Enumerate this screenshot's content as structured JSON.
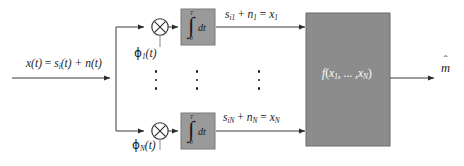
{
  "diagram": {
    "input_signal": {
      "label_plain": "x(t) = sᵢ(t) + n(t)",
      "x_of_t": "x(t) ",
      "equals": "= ",
      "s_sym": "s",
      "s_sub": "i",
      "s_tail": "(t) + ",
      "n_sym": "n",
      "n_tail": "(t)"
    },
    "branches": [
      {
        "index": "1",
        "multiplier_symbol": "✕",
        "multiplier_name": "multiplier",
        "reference_label_plain": "ϕ₁(t)",
        "reference_glyph": "ϕ",
        "reference_sub": "1",
        "reference_tail": "(t)",
        "integrator_upper_limit": "T",
        "integrator_lower_limit": "0",
        "integrator_symbol": "∫",
        "integrator_differential": "dt",
        "output_label_plain": "sᵢ₁ + n₁ = x₁",
        "out_s": "s",
        "out_s_sub": "i1",
        "out_plus": " + ",
        "out_n": "n",
        "out_n_sub": "1",
        "out_eq": " = ",
        "out_x": "x",
        "out_x_sub": "1"
      },
      {
        "index": "N",
        "multiplier_symbol": "✕",
        "multiplier_name": "multiplier",
        "reference_label_plain": "ϕₙ(t)",
        "reference_glyph": "ϕ",
        "reference_sub": "N",
        "reference_tail": "(t)",
        "integrator_upper_limit": "T",
        "integrator_lower_limit": "0",
        "integrator_symbol": "∫",
        "integrator_differential": "dt",
        "output_label_plain": "sᵢₙ + nₙ = xₙ",
        "out_s": "s",
        "out_s_sub": "iN",
        "out_plus": " + ",
        "out_n": "n",
        "out_n_sub": "N",
        "out_eq": " = ",
        "out_x": "x",
        "out_x_sub": "N"
      }
    ],
    "ellipsis": {
      "dot": "•",
      "count": 3,
      "columns": [
        "branch-column",
        "integrator-column",
        "output-column"
      ]
    },
    "decision_block": {
      "label_plain": "f(x₁, ..., xₙ)",
      "f_sym": "f",
      "open": "(",
      "x1": "x",
      "x1_sub": "1",
      "comma_dots": ", ... ,",
      "xn": "x",
      "xn_sub": "N",
      "close": ")",
      "name": "decision-function-block"
    },
    "output": {
      "label_plain": "m̂",
      "symbol": "m",
      "hat": "ˆ"
    },
    "colors": {
      "block_fill": "#8c8c8c",
      "block_stroke": "#6b6b6b",
      "integrator_fill": "#9a9a9a",
      "integrator_stroke": "#7a7a7a",
      "line": "#3a3a3a",
      "text": "#1a1a1a",
      "block_text": "#ffffff",
      "background": "#ffffff"
    }
  }
}
